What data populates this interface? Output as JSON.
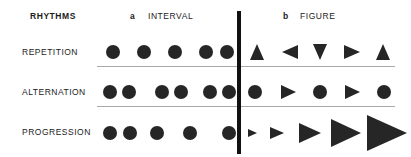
{
  "diagram": {
    "title": "RHYTHMS",
    "columns": [
      {
        "key": "a",
        "label": "INTERVAL"
      },
      {
        "key": "b",
        "label": "FIGURE"
      }
    ],
    "row_labels": [
      "REPETITION",
      "ALTERNATION",
      "PROGRESSION"
    ],
    "colors": {
      "shape": "#262626",
      "divider": "#111111",
      "separator": "#a8a8a8",
      "text": "#1b1b1b",
      "background": "#ffffff"
    }
  },
  "chart_data": {
    "type": "diagram",
    "title": "RHYTHMS",
    "grid": {
      "rows": [
        "REPETITION",
        "ALTERNATION",
        "PROGRESSION"
      ],
      "columns": [
        "a INTERVAL",
        "b FIGURE"
      ]
    },
    "cells": [
      {
        "row": "REPETITION",
        "column": "a INTERVAL",
        "note": "Five identical circles at equal intervals",
        "shapes": [
          {
            "kind": "circle",
            "cx": 113,
            "cy": 52,
            "size": 14
          },
          {
            "kind": "circle",
            "cx": 144,
            "cy": 52,
            "size": 14
          },
          {
            "kind": "circle",
            "cx": 175,
            "cy": 52,
            "size": 14
          },
          {
            "kind": "circle",
            "cx": 206,
            "cy": 52,
            "size": 14
          },
          {
            "kind": "circle",
            "cx": 227,
            "cy": 52,
            "size": 14
          }
        ]
      },
      {
        "row": "REPETITION",
        "column": "b FIGURE",
        "note": "Five triangles of equal size, rotated: up, left, down, right, up",
        "shapes": [
          {
            "kind": "triangle",
            "direction": "up",
            "cx": 257,
            "cy": 52,
            "size": 16
          },
          {
            "kind": "triangle",
            "direction": "left",
            "cx": 290,
            "cy": 52,
            "size": 16
          },
          {
            "kind": "triangle",
            "direction": "down",
            "cx": 320,
            "cy": 52,
            "size": 16
          },
          {
            "kind": "triangle",
            "direction": "right",
            "cx": 352,
            "cy": 52,
            "size": 16
          },
          {
            "kind": "triangle",
            "direction": "up",
            "cx": 383,
            "cy": 52,
            "size": 16
          }
        ]
      },
      {
        "row": "ALTERNATION",
        "column": "a INTERVAL",
        "note": "Three pairs of circles: short gap inside pairs, long gap between pairs",
        "shapes": [
          {
            "kind": "circle",
            "cx": 110,
            "cy": 92,
            "size": 14
          },
          {
            "kind": "circle",
            "cx": 129,
            "cy": 92,
            "size": 14
          },
          {
            "kind": "circle",
            "cx": 162,
            "cy": 92,
            "size": 14
          },
          {
            "kind": "circle",
            "cx": 181,
            "cy": 92,
            "size": 14
          },
          {
            "kind": "circle",
            "cx": 210,
            "cy": 92,
            "size": 14
          },
          {
            "kind": "circle",
            "cx": 229,
            "cy": 92,
            "size": 14
          }
        ]
      },
      {
        "row": "ALTERNATION",
        "column": "b FIGURE",
        "note": "Circle and right-pointing triangle alternating across five positions",
        "shapes": [
          {
            "kind": "circle",
            "cx": 255,
            "cy": 92,
            "size": 14
          },
          {
            "kind": "triangle",
            "direction": "right",
            "cx": 288,
            "cy": 92,
            "size": 15
          },
          {
            "kind": "circle",
            "cx": 320,
            "cy": 92,
            "size": 14
          },
          {
            "kind": "triangle",
            "direction": "right",
            "cx": 352,
            "cy": 92,
            "size": 15
          },
          {
            "kind": "circle",
            "cx": 384,
            "cy": 92,
            "size": 14
          }
        ]
      },
      {
        "row": "PROGRESSION",
        "column": "a INTERVAL",
        "note": "Five identical circles with progressively increasing intervals",
        "shapes": [
          {
            "kind": "circle",
            "cx": 110,
            "cy": 133,
            "size": 14
          },
          {
            "kind": "circle",
            "cx": 130,
            "cy": 133,
            "size": 14
          },
          {
            "kind": "circle",
            "cx": 157,
            "cy": 133,
            "size": 14
          },
          {
            "kind": "circle",
            "cx": 190,
            "cy": 133,
            "size": 14
          },
          {
            "kind": "circle",
            "cx": 229,
            "cy": 133,
            "size": 14
          }
        ]
      },
      {
        "row": "PROGRESSION",
        "column": "b FIGURE",
        "note": "Five right-pointing triangles of progressively increasing size",
        "shapes": [
          {
            "kind": "triangle",
            "direction": "right",
            "cx": 252,
            "cy": 133,
            "size": 9
          },
          {
            "kind": "triangle",
            "direction": "right",
            "cx": 277,
            "cy": 133,
            "size": 14
          },
          {
            "kind": "triangle",
            "direction": "right",
            "cx": 310,
            "cy": 133,
            "size": 22
          },
          {
            "kind": "triangle",
            "direction": "right",
            "cx": 346,
            "cy": 133,
            "size": 30
          },
          {
            "kind": "triangle",
            "direction": "right",
            "cx": 387,
            "cy": 133,
            "size": 40
          }
        ]
      }
    ]
  }
}
